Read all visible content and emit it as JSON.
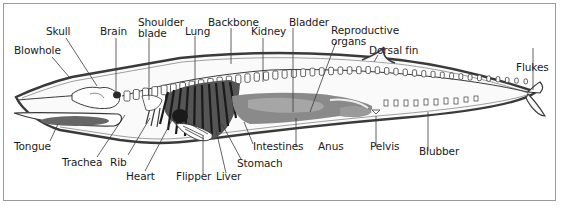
{
  "diagram": {
    "colors": {
      "outline": "#3a3a3a",
      "bone": "#ffffff",
      "organ_dark": "#2a2a2a",
      "organ_mid": "#7a7a7a",
      "organ_light": "#b8b8b8",
      "frame": "#9a9a9a"
    },
    "labels_top": [
      {
        "id": "blowhole",
        "text": "Blowhole"
      },
      {
        "id": "skull",
        "text": "Skull"
      },
      {
        "id": "brain",
        "text": "Brain"
      },
      {
        "id": "shoulder_blade_1",
        "text": "Shoulder"
      },
      {
        "id": "shoulder_blade_2",
        "text": "blade"
      },
      {
        "id": "lung",
        "text": "Lung"
      },
      {
        "id": "backbone",
        "text": "Backbone"
      },
      {
        "id": "kidney",
        "text": "Kidney"
      },
      {
        "id": "bladder",
        "text": "Bladder"
      },
      {
        "id": "reproductive_1",
        "text": "Reproductive"
      },
      {
        "id": "reproductive_2",
        "text": "organs"
      },
      {
        "id": "dorsal_fin",
        "text": "Dorsal fin"
      },
      {
        "id": "flukes",
        "text": "Flukes"
      }
    ],
    "labels_bottom": [
      {
        "id": "tongue",
        "text": "Tongue"
      },
      {
        "id": "trachea",
        "text": "Trachea"
      },
      {
        "id": "rib",
        "text": "Rib"
      },
      {
        "id": "heart",
        "text": "Heart"
      },
      {
        "id": "flipper",
        "text": "Flipper"
      },
      {
        "id": "liver",
        "text": "Liver"
      },
      {
        "id": "stomach",
        "text": "Stomach"
      },
      {
        "id": "intestines",
        "text": "Intestines"
      },
      {
        "id": "anus",
        "text": "Anus"
      },
      {
        "id": "pelvis",
        "text": "Pelvis"
      },
      {
        "id": "blubber",
        "text": "Blubber"
      }
    ]
  }
}
